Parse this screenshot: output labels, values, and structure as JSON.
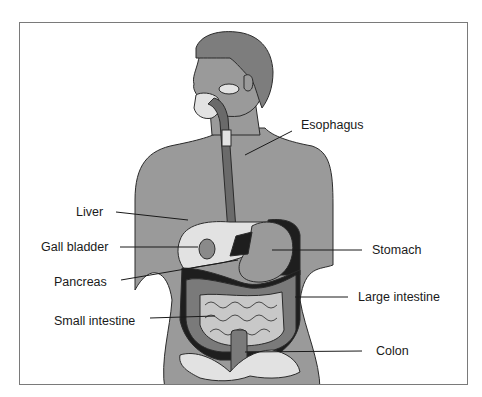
{
  "diagram": {
    "colors": {
      "skin": "#9a9a9a",
      "hair": "#7d7d7d",
      "light_organ": "#e2e2e2",
      "dark_organ": "#1e1e1e",
      "mid_organ": "#8a8a8a",
      "outline": "#2b2b2b"
    },
    "labels": [
      {
        "id": "esophagus",
        "text": "Esophagus"
      },
      {
        "id": "liver",
        "text": "Liver"
      },
      {
        "id": "gall-bladder",
        "text": "Gall bladder"
      },
      {
        "id": "stomach",
        "text": "Stomach"
      },
      {
        "id": "pancreas",
        "text": "Pancreas"
      },
      {
        "id": "large-intestine",
        "text": "Large intestine"
      },
      {
        "id": "small-intestine",
        "text": "Small intestine"
      },
      {
        "id": "colon",
        "text": "Colon"
      }
    ]
  }
}
